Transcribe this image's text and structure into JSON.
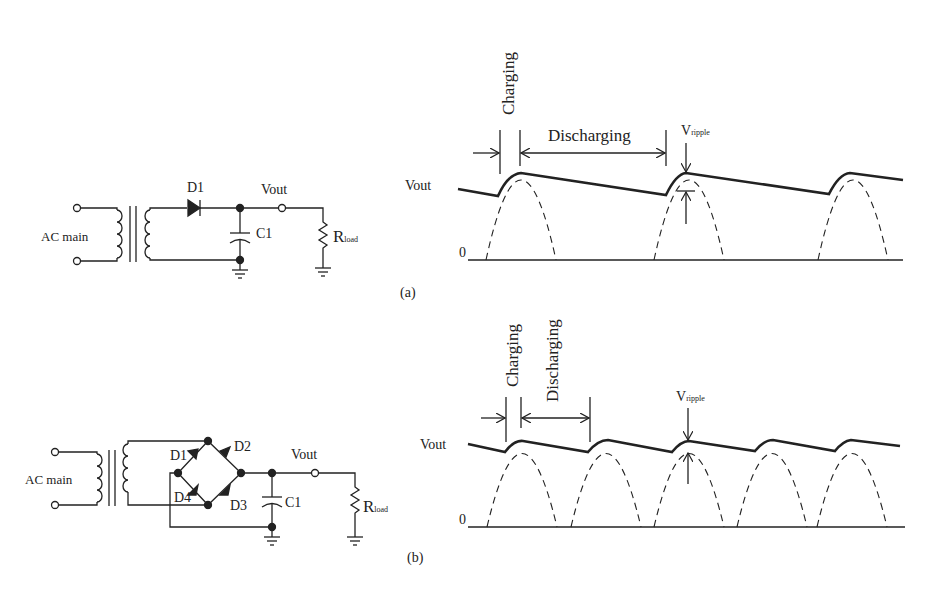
{
  "circuit_a": {
    "source_label": "AC main",
    "diode_label": "D1",
    "output_label": "Vout",
    "capacitor_label": "C1",
    "load_label": "R",
    "load_sub": "load"
  },
  "circuit_b": {
    "source_label": "AC main",
    "diode_labels": [
      "D1",
      "D2",
      "D3",
      "D4"
    ],
    "output_label": "Vout",
    "capacitor_label": "C1",
    "load_label": "R",
    "load_sub": "load"
  },
  "waveform_a": {
    "y_label": "Vout",
    "zero_label": "0",
    "charging_label": "Charging",
    "discharging_label": "Discharging",
    "ripple_label": "V",
    "ripple_sub": "ripple",
    "caption": "(a)"
  },
  "waveform_b": {
    "y_label": "Vout",
    "zero_label": "0",
    "charging_label": "Charging",
    "discharging_label": "Discharging",
    "ripple_label": "V",
    "ripple_sub": "ripple",
    "caption": "(b)"
  }
}
